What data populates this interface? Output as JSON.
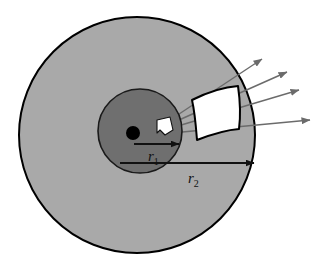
{
  "figure": {
    "background_color": "#ffffff"
  },
  "colors": {
    "outer_disk_fill": "#a9a9a9",
    "inner_disk_fill": "#6f6f6f",
    "outline": "#000000",
    "ray_color": "#7a7a7a",
    "detector_fill": "#ffffff",
    "sample_fill": "#ffffff",
    "source_fill": "#000000",
    "label_color": "#111111"
  },
  "geometry": {
    "outer_circle": {
      "cx": 137,
      "cy": 135,
      "r": 118
    },
    "inner_circle": {
      "cx": 140,
      "cy": 131,
      "r": 42
    },
    "source_point": {
      "cx": 133,
      "cy": 133,
      "r": 7
    },
    "canvas": {
      "width": 327,
      "height": 275
    }
  },
  "labels": {
    "r1": {
      "base": "r",
      "subscript": "1",
      "x": 148,
      "y": 159
    },
    "r2": {
      "base": "r",
      "subscript": "2",
      "x": 188,
      "y": 181
    }
  },
  "arrows": {
    "r1_arrow": {
      "x1": 134,
      "y1": 144,
      "x2": 179,
      "y2": 144,
      "label": "r1"
    },
    "r2_arrow": {
      "x1": 120,
      "y1": 163,
      "x2": 254,
      "y2": 163,
      "label": "r2"
    }
  },
  "rays": [
    {
      "id": "ray-1",
      "x1": 161,
      "y1": 126,
      "x2": 262,
      "y2": 59
    },
    {
      "id": "ray-2",
      "x1": 161,
      "y1": 128,
      "x2": 287,
      "y2": 72
    },
    {
      "id": "ray-3",
      "x1": 161,
      "y1": 131,
      "x2": 299,
      "y2": 90
    },
    {
      "id": "ray-4",
      "x1": 161,
      "y1": 134,
      "x2": 310,
      "y2": 120
    }
  ],
  "sample": {
    "name": "sample-element",
    "points": "157,120 170,117 173,130 165,135 160,130 157,133"
  },
  "detector": {
    "name": "detector-segment",
    "outline_path": "M 192,100 C 208,92 224,87 238,86 C 240,100 241,114 239,129 C 225,130 210,135 197,140 C 196,127 195,113 192,100 Z"
  },
  "annotations": {
    "outer_region_label": "outer shielding region",
    "inner_region_label": "inner moderator region",
    "source_label": "point source",
    "detector_label": "curved detector element",
    "rays_label": "emitted particle trajectories"
  }
}
